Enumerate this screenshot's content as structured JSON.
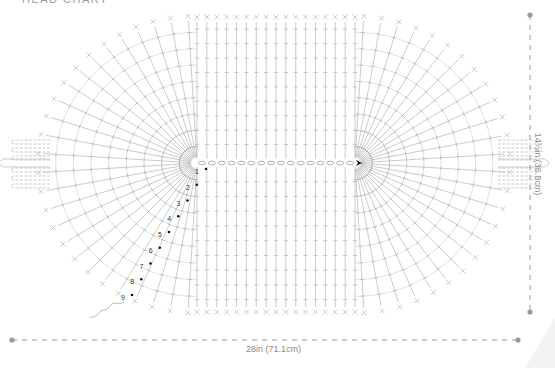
{
  "title": "HEAD CHART",
  "dimensions": {
    "width_label": "28in (71.1cm)",
    "height_label": "14½in (36.8cm)"
  },
  "row_labels": [
    "1",
    "2",
    "3",
    "4",
    "5",
    "6",
    "7",
    "8",
    "9"
  ],
  "colors": {
    "stitch": "#b4b4b4",
    "dimension_line": "#9a9a9a",
    "marker": "#111111",
    "text": "#8a8a8a"
  },
  "geometry": {
    "chain_start_x": 197,
    "chain_end_x": 355,
    "chain_y": 163,
    "chain_count": 16,
    "top_y": 16,
    "bottom_y": 313,
    "left_x": 38,
    "right_x": 510
  }
}
